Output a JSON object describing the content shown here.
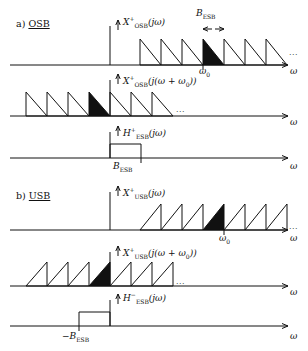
{
  "figure": {
    "sections": [
      {
        "id": "a",
        "marker": "a)",
        "title": "OSB",
        "panels": [
          {
            "id": "osb-spectrum",
            "signal_label": "X",
            "signal_sup": "+",
            "signal_sub": "OSB",
            "signal_arg": "(jω)",
            "axis_label": "ω",
            "bandwidth_label": "B",
            "bandwidth_sub": "ESB",
            "center_label": "ω",
            "center_sub": "0",
            "ellipsis": "...",
            "tooth_direction": "falling",
            "teeth": 8,
            "filled_index": 3
          },
          {
            "id": "osb-shifted",
            "signal_label": "X",
            "signal_sup": "+",
            "signal_sub": "OSB",
            "signal_arg": "(j(ω + ω",
            "signal_arg_sub": "0",
            "signal_arg_end": "))",
            "axis_label": "ω",
            "ellipsis": "...",
            "tooth_direction": "falling",
            "teeth": 7,
            "filled_index": 3
          },
          {
            "id": "osb-filter",
            "signal_label": "H",
            "signal_sup": "+",
            "signal_sub": "ESB",
            "signal_arg": "(jω)",
            "axis_label": "ω",
            "edge_label": "B",
            "edge_sub": "ESB",
            "filter_side": "right"
          }
        ]
      },
      {
        "id": "b",
        "marker": "b)",
        "title": "USB",
        "panels": [
          {
            "id": "usb-spectrum",
            "signal_label": "X",
            "signal_sup": "+",
            "signal_sub": "USB",
            "signal_arg": "(jω)",
            "axis_label": "ω",
            "center_label": "ω",
            "center_sub": "0",
            "ellipsis": "...",
            "tooth_direction": "rising",
            "teeth": 8,
            "filled_index": 3
          },
          {
            "id": "usb-shifted",
            "signal_label": "X",
            "signal_sup": "+",
            "signal_sub": "USB",
            "signal_arg": "(j(ω + ω",
            "signal_arg_sub": "0",
            "signal_arg_end": "))",
            "axis_label": "ω",
            "ellipsis": "...",
            "tooth_direction": "rising",
            "teeth": 7,
            "filled_index": 3
          },
          {
            "id": "usb-filter",
            "signal_label": "H",
            "signal_sup": "−",
            "signal_sub": "ESB",
            "signal_arg": "(jω)",
            "axis_label": "ω",
            "edge_label": "−B",
            "edge_sub": "ESB",
            "filter_side": "left"
          }
        ]
      }
    ]
  }
}
